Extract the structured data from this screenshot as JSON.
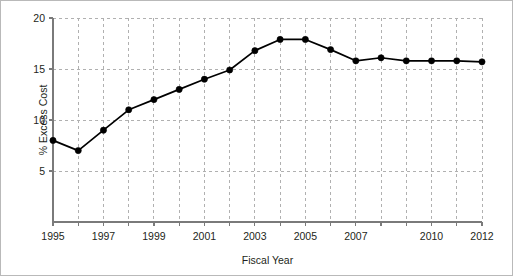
{
  "chart_data": {
    "type": "line",
    "title": "",
    "xlabel": "Fiscal Year",
    "ylabel": "% Excess Cost",
    "x": [
      1995,
      1996,
      1997,
      1998,
      1999,
      2000,
      2001,
      2002,
      2003,
      2004,
      2005,
      2006,
      2007,
      2008,
      2009,
      2010,
      2011,
      2012
    ],
    "values": [
      8.0,
      7.0,
      9.0,
      11.0,
      12.0,
      13.0,
      14.0,
      14.9,
      16.8,
      17.9,
      17.9,
      16.9,
      15.8,
      16.1,
      15.8,
      15.8,
      15.8,
      15.7
    ],
    "series": [
      {
        "name": "% Excess Cost",
        "values": [
          8.0,
          7.0,
          9.0,
          11.0,
          12.0,
          13.0,
          14.0,
          14.9,
          16.8,
          17.9,
          17.9,
          16.9,
          15.8,
          16.1,
          15.8,
          15.8,
          15.8,
          15.7
        ]
      }
    ],
    "xlim": [
      1995,
      2012
    ],
    "ylim": [
      0,
      20
    ],
    "y_ticks": [
      5,
      10,
      15,
      20
    ],
    "y_tick_labels": [
      "5",
      "10",
      "15",
      "20"
    ],
    "x_ticks": [
      1995,
      1996,
      1997,
      1998,
      1999,
      2000,
      2001,
      2002,
      2003,
      2004,
      2005,
      2006,
      2007,
      2008,
      2009,
      2010,
      2011,
      2012
    ],
    "x_tick_labels_shown": [
      {
        "value": 1995,
        "label": "1995"
      },
      {
        "value": 1997,
        "label": "1997"
      },
      {
        "value": 1999,
        "label": "1999"
      },
      {
        "value": 2001,
        "label": "2001"
      },
      {
        "value": 2003,
        "label": "2003"
      },
      {
        "value": 2005,
        "label": "2005"
      },
      {
        "value": 2007,
        "label": "2007"
      },
      {
        "value": 2010,
        "label": "2010"
      },
      {
        "value": 2012,
        "label": "2012"
      }
    ],
    "grid": true,
    "grid_style": "dashed",
    "legend": null,
    "legend_position": "none",
    "marker": "circle-filled",
    "colors": {
      "line": "#000000",
      "marker": "#000000",
      "grid": "#b0b0b0",
      "axis": "#7a7a7a",
      "text": "#231f20",
      "background": "#ffffff",
      "border": "#b9b9b9"
    }
  }
}
